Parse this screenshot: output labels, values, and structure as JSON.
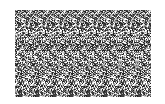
{
  "image": {
    "type": "random-dot autostereogram",
    "palette": [
      "#ffffff",
      "#d0d0d0",
      "#a0a0a0",
      "#707070",
      "#404040",
      "#202020"
    ],
    "background": "#ffffff",
    "pattern_region": {
      "x": 15,
      "y": 10,
      "width": 136,
      "height": 87
    },
    "strip_width": 17
  }
}
